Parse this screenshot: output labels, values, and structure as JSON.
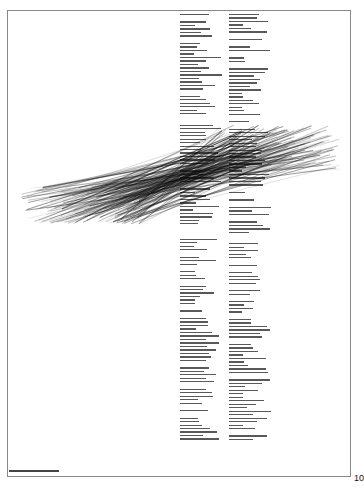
{
  "document": {
    "type": "scanned two-column text page (text illegible at this resolution)",
    "page_number": "10",
    "footer_text": "illegible footer line"
  }
}
